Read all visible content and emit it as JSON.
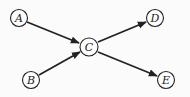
{
  "diagram": {
    "type": "directed-graph",
    "nodes": [
      {
        "id": "A",
        "label": "A",
        "x": 19,
        "y": 18
      },
      {
        "id": "B",
        "label": "B",
        "x": 31,
        "y": 80
      },
      {
        "id": "C",
        "label": "C",
        "x": 89,
        "y": 47
      },
      {
        "id": "D",
        "label": "D",
        "x": 155,
        "y": 18
      },
      {
        "id": "E",
        "label": "E",
        "x": 166,
        "y": 80
      }
    ],
    "edges": [
      {
        "from": "A",
        "to": "C"
      },
      {
        "from": "B",
        "to": "C"
      },
      {
        "from": "C",
        "to": "D"
      },
      {
        "from": "C",
        "to": "E"
      }
    ],
    "colors": {
      "stroke": "#222222",
      "background": "#fbfbfb"
    }
  }
}
